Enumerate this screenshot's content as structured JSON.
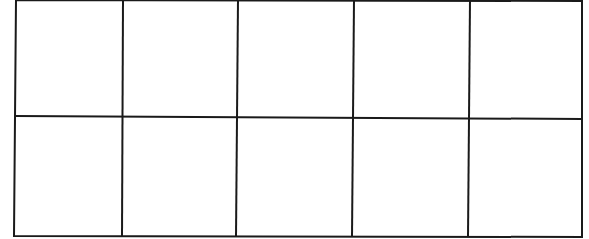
{
  "diagram": {
    "type": "grid",
    "rows": 2,
    "columns": 5,
    "line_color": "#1a1a1a",
    "background": "#ffffff",
    "cells": [
      [
        "",
        "",
        "",
        "",
        ""
      ],
      [
        "",
        "",
        "",
        "",
        ""
      ]
    ]
  }
}
